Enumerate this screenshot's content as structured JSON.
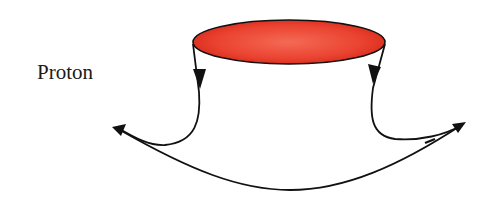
{
  "diagram": {
    "label": "Proton",
    "colors": {
      "ellipse_fill_center": "#f25a45",
      "ellipse_fill_edge": "#e0301f",
      "stroke": "#111111"
    }
  }
}
